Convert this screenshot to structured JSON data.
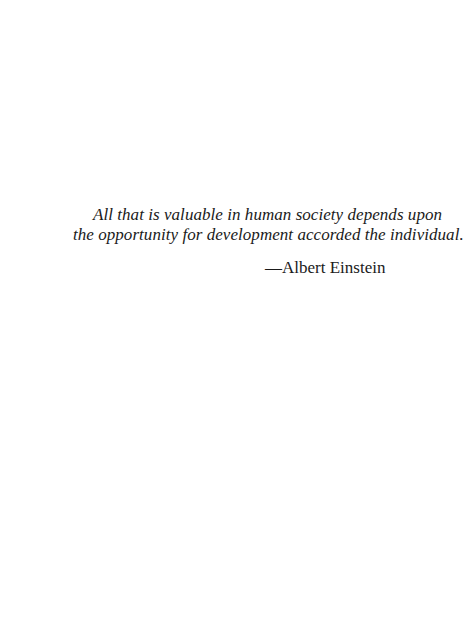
{
  "epigraph": {
    "quote_lines": [
      "All that is valuable in human society depends upon",
      "the opportunity for development accorded the individual."
    ],
    "attribution": "—Albert Einstein"
  }
}
